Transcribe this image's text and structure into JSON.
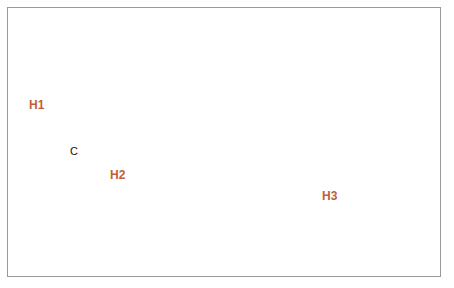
{
  "figure": {
    "type": "annotated-map",
    "region": "contiguous United States",
    "frame_border_color": "#9a9a9a",
    "background_color": "#ffffff"
  },
  "map": {
    "land_fill": "#d7dac0",
    "state_border_color": "#9a9c84",
    "water_fill": "#ffffff",
    "coast_border_color": "#8e9079"
  },
  "annotations": {
    "highlight_color": "#e03a20",
    "highlight_label_color": "#c0603a",
    "cluster_color": "#111111",
    "circles": [
      {
        "id": "H1",
        "label": "H1",
        "style": "highlight",
        "stroke": "#e03a20",
        "stroke_width": 2.2,
        "cx": 68,
        "cy": 121,
        "r": 51,
        "label_x": 29,
        "label_y": 98,
        "region": "Pacific Northwest / Northern California"
      },
      {
        "id": "H2",
        "label": "H2",
        "style": "highlight",
        "stroke": "#e03a20",
        "stroke_width": 2.2,
        "cx": 108,
        "cy": 149,
        "r": 53,
        "label_x": 110,
        "label_y": 168,
        "region": "Southwest / Nevada / Arizona"
      },
      {
        "id": "H3",
        "label": "H3",
        "style": "highlight",
        "stroke": "#e03a20",
        "stroke_width": 2.6,
        "cx": 333,
        "cy": 194,
        "r": 73,
        "label_x": 322,
        "label_y": 189,
        "region": "Southeast / Gulf states / Florida"
      },
      {
        "id": "C",
        "label": "C",
        "style": "cluster",
        "stroke": "#111111",
        "stroke_width": 2.2,
        "cx": 75,
        "cy": 152,
        "r": 17,
        "label_x": 70,
        "label_y": 145,
        "region": "Southern California"
      }
    ]
  }
}
